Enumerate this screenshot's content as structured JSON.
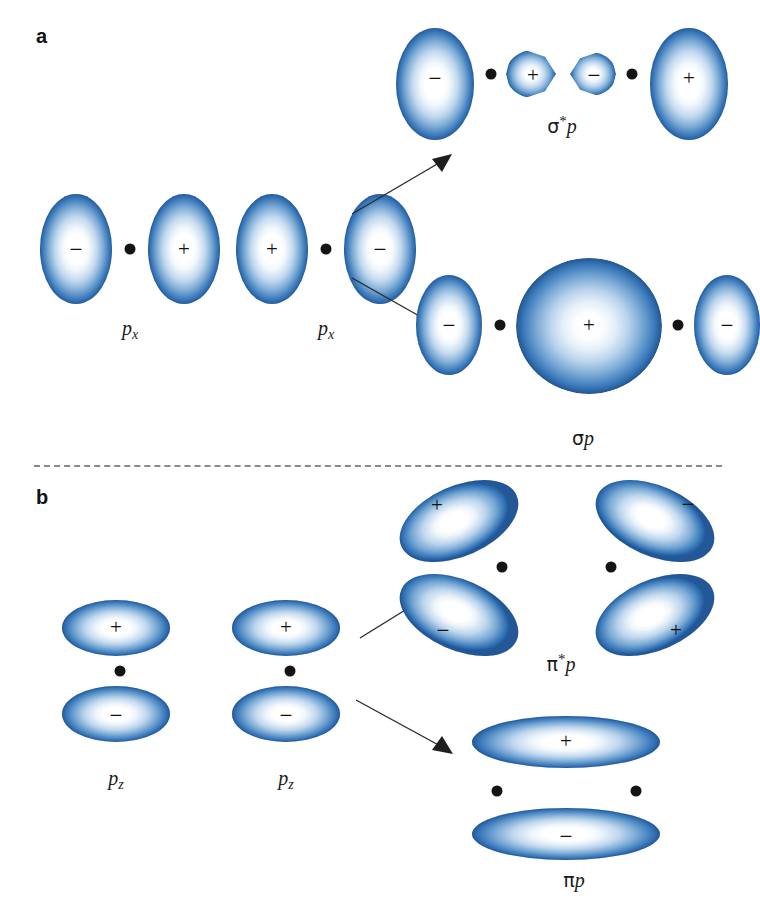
{
  "figure": {
    "panels": [
      {
        "id": "a",
        "letter": "a",
        "description": "Sigma overlap of two p_x orbitals",
        "inputs": [
          {
            "label_html": "p_x",
            "label_plain": "px",
            "signs": [
              "-",
              "+"
            ]
          },
          {
            "label_html": "p_x",
            "label_plain": "px",
            "signs": [
              "+",
              "-"
            ]
          }
        ],
        "outputs": [
          {
            "name": "sigma-star-p",
            "label_plain": "σ*p",
            "signs": [
              "-",
              "+",
              "-",
              "+"
            ],
            "type": "antibonding"
          },
          {
            "name": "sigma-p",
            "label_plain": "σp",
            "signs": [
              "-",
              "+",
              "-"
            ],
            "type": "bonding"
          }
        ]
      },
      {
        "id": "b",
        "letter": "b",
        "description": "Pi overlap of two p_z orbitals",
        "inputs": [
          {
            "label_html": "p_z",
            "label_plain": "pz",
            "signs": [
              "+",
              "-"
            ]
          },
          {
            "label_html": "p_z",
            "label_plain": "pz",
            "signs": [
              "+",
              "-"
            ]
          }
        ],
        "outputs": [
          {
            "name": "pi-star-p",
            "label_plain": "π*p",
            "signs": [
              "+",
              "-",
              "-",
              "+"
            ],
            "type": "antibonding"
          },
          {
            "name": "pi-p",
            "label_plain": "πp",
            "signs": [
              "+",
              "-"
            ],
            "type": "bonding"
          }
        ]
      }
    ],
    "signs": {
      "plus": "+",
      "minus": "−"
    },
    "greek": {
      "sigma": "σ",
      "pi": "π",
      "star": "*"
    },
    "labels": {
      "px_left": {
        "base": "p",
        "sub": "x"
      },
      "px_right": {
        "base": "p",
        "sub": "x"
      },
      "pz_left": {
        "base": "p",
        "sub": "z"
      },
      "pz_right": {
        "base": "p",
        "sub": "z"
      },
      "sigma_star_p": {
        "greek": "σ",
        "star": "*",
        "base": "p"
      },
      "sigma_p": {
        "greek": "σ",
        "base": "p"
      },
      "pi_star_p": {
        "greek": "π",
        "star": "*",
        "base": "p"
      },
      "pi_p": {
        "greek": "π",
        "base": "p"
      }
    },
    "colors": {
      "orbital_edge": "#2a62a4",
      "orbital_mid": "#7aaad5",
      "orbital_center": "#ffffff",
      "nucleus": "#141414",
      "arrow": "#2b2b2b",
      "divider": "#8a8a8a",
      "text": "#1a1a1a",
      "background": "#ffffff"
    }
  }
}
